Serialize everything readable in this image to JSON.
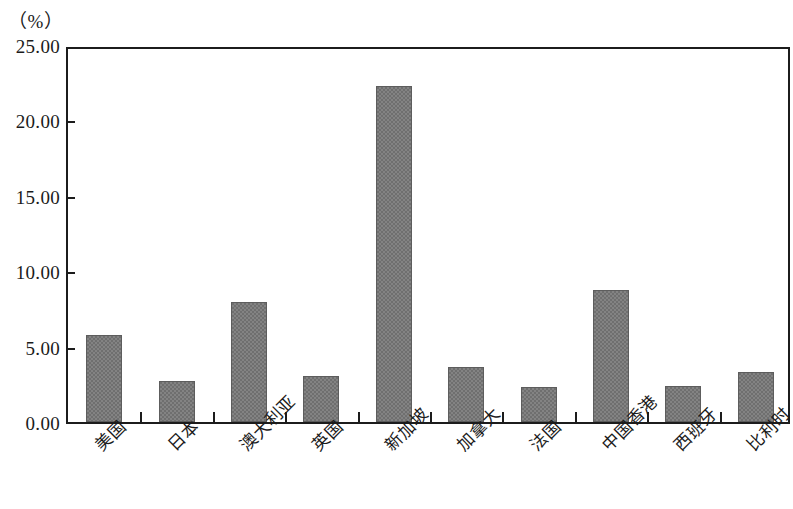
{
  "chart_data": {
    "type": "bar",
    "title": "",
    "subtitle": "",
    "unit_label": "（%）",
    "xlabel": "",
    "ylabel": "",
    "ylim": [
      0,
      25
    ],
    "y_tick_step": 5,
    "grid": false,
    "legend": false,
    "bar_color": "#6f6f6f",
    "axis_color": "#1c1c1c",
    "categories": [
      "美国",
      "日本",
      "澳大利亚",
      "英国",
      "新加坡",
      "加拿大",
      "法国",
      "中国香港",
      "西班牙",
      "比利时"
    ],
    "values": [
      5.8,
      2.75,
      7.95,
      3.05,
      22.3,
      3.65,
      2.3,
      8.75,
      2.4,
      3.3
    ],
    "y_ticks": [
      {
        "value": 25.0,
        "label": "25.00"
      },
      {
        "value": 20.0,
        "label": "20.00"
      },
      {
        "value": 15.0,
        "label": "15.00"
      },
      {
        "value": 10.0,
        "label": "10.00"
      },
      {
        "value": 5.0,
        "label": "5.00"
      },
      {
        "value": 0.0,
        "label": "0.00"
      }
    ]
  }
}
